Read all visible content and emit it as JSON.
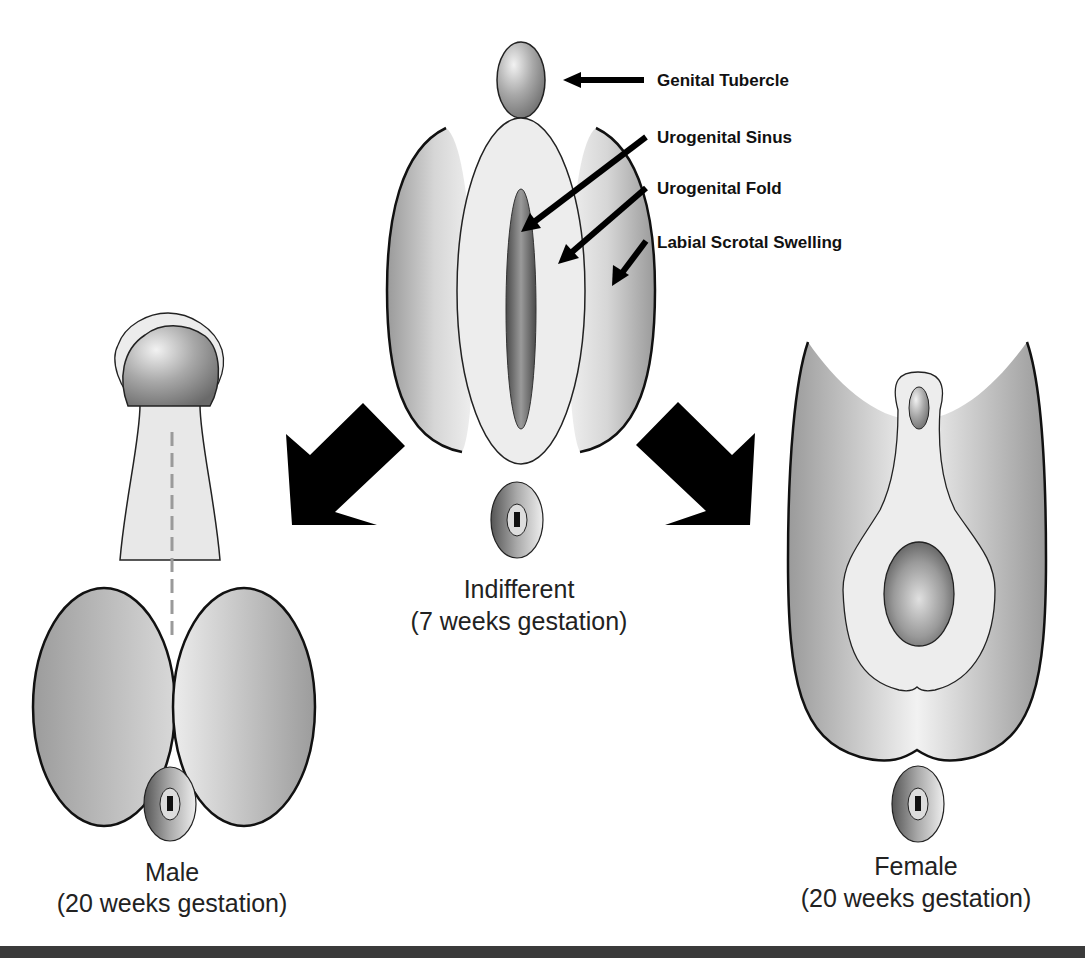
{
  "labels": {
    "genital_tubercle": "Genital Tubercle",
    "urogenital_sinus": "Urogenital Sinus",
    "urogenital_fold": "Urogenital Fold",
    "labial_scrotal_swelling": "Labial Scrotal Swelling"
  },
  "stages": {
    "indifferent": {
      "title": "Indifferent",
      "subtitle": "(7 weeks gestation)"
    },
    "male": {
      "title": "Male",
      "subtitle": "(20 weeks gestation)"
    },
    "female": {
      "title": "Female",
      "subtitle": "(20 weeks gestation)"
    }
  },
  "colors": {
    "background": "#ffffff",
    "outline": "#111111",
    "arrow": "#000000",
    "tissue_light": "#eeeeee",
    "tissue_mid": "#b5b5b5",
    "tissue_dark": "#6e6e6e",
    "bottom_bar": "#3a3a3a"
  }
}
